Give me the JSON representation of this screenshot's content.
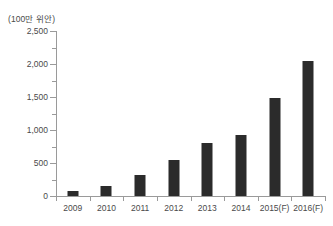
{
  "chart_data": {
    "type": "bar",
    "title": "",
    "subtitle": "",
    "unit_label": "(100만 위안)",
    "xlabel": "",
    "ylabel": "",
    "categories": [
      "2009",
      "2010",
      "2011",
      "2012",
      "2013",
      "2014",
      "2015(F)",
      "2016(F)"
    ],
    "values": [
      70,
      155,
      320,
      540,
      805,
      925,
      1490,
      2045
    ],
    "series": [
      {
        "name": "",
        "values": [
          70,
          155,
          320,
          540,
          805,
          925,
          1490,
          2045
        ]
      }
    ],
    "ylim": [
      0,
      2500
    ],
    "y_ticks": [
      0,
      500,
      1000,
      1500,
      2000,
      2500
    ],
    "y_tick_labels": [
      "0",
      "500",
      "1,000",
      "1,500",
      "2,000",
      "2,500"
    ],
    "y_minor_ticks": [
      250,
      750,
      1250,
      1750,
      2250
    ],
    "grid": false,
    "legend": "none",
    "bar_color": "#2b2b2b",
    "axis_color": "#9a9a9a",
    "text_color": "#4a4a4a",
    "background": "#ffffff"
  }
}
